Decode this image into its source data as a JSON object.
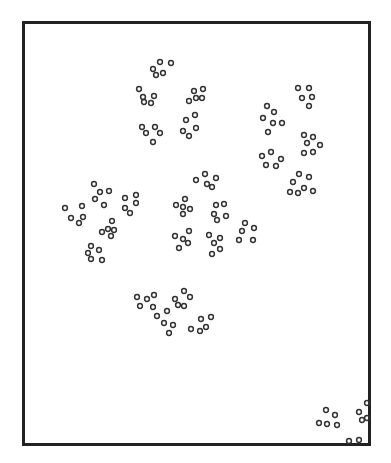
{
  "figure": {
    "kind": "scattered ring clusters within rectangular frame",
    "frame": {
      "x": 22,
      "y": 21,
      "width": 349,
      "height": 425,
      "stroke": "#222222"
    },
    "marker": {
      "shape": "ring",
      "radius": 2.4,
      "stroke": "#333333",
      "stroke_width": 1.5
    },
    "caption": ""
  },
  "points": [
    [
      160,
      62
    ],
    [
      171,
      63
    ],
    [
      153,
      69
    ],
    [
      163,
      73
    ],
    [
      156,
      75
    ],
    [
      139,
      89
    ],
    [
      143,
      97
    ],
    [
      154,
      96
    ],
    [
      144,
      102
    ],
    [
      151,
      103
    ],
    [
      203,
      89
    ],
    [
      194,
      91
    ],
    [
      196,
      98
    ],
    [
      202,
      98
    ],
    [
      189,
      101
    ],
    [
      142,
      127
    ],
    [
      155,
      127
    ],
    [
      146,
      133
    ],
    [
      160,
      133
    ],
    [
      153,
      142
    ],
    [
      195,
      115
    ],
    [
      186,
      120
    ],
    [
      196,
      128
    ],
    [
      183,
      131
    ],
    [
      189,
      136
    ],
    [
      298,
      88
    ],
    [
      309,
      88
    ],
    [
      302,
      98
    ],
    [
      312,
      97
    ],
    [
      309,
      106
    ],
    [
      267,
      106
    ],
    [
      274,
      112
    ],
    [
      263,
      118
    ],
    [
      273,
      123
    ],
    [
      282,
      123
    ],
    [
      268,
      132
    ],
    [
      304,
      135
    ],
    [
      313,
      137
    ],
    [
      307,
      143
    ],
    [
      320,
      145
    ],
    [
      304,
      153
    ],
    [
      313,
      152
    ],
    [
      262,
      156
    ],
    [
      271,
      152
    ],
    [
      281,
      159
    ],
    [
      266,
      165
    ],
    [
      276,
      166
    ],
    [
      299,
      174
    ],
    [
      309,
      177
    ],
    [
      293,
      182
    ],
    [
      304,
      188
    ],
    [
      313,
      191
    ],
    [
      290,
      192
    ],
    [
      298,
      193
    ],
    [
      94,
      184
    ],
    [
      100,
      192
    ],
    [
      109,
      191
    ],
    [
      95,
      199
    ],
    [
      104,
      205
    ],
    [
      65,
      208
    ],
    [
      82,
      206
    ],
    [
      71,
      218
    ],
    [
      83,
      217
    ],
    [
      79,
      223
    ],
    [
      125,
      198
    ],
    [
      136,
      195
    ],
    [
      136,
      203
    ],
    [
      125,
      208
    ],
    [
      130,
      213
    ],
    [
      112,
      221
    ],
    [
      108,
      229
    ],
    [
      114,
      230
    ],
    [
      102,
      232
    ],
    [
      111,
      236
    ],
    [
      91,
      246
    ],
    [
      99,
      250
    ],
    [
      88,
      253
    ],
    [
      91,
      259
    ],
    [
      102,
      260
    ],
    [
      205,
      174
    ],
    [
      216,
      178
    ],
    [
      196,
      180
    ],
    [
      207,
      184
    ],
    [
      212,
      187
    ],
    [
      185,
      199
    ],
    [
      176,
      205
    ],
    [
      183,
      207
    ],
    [
      190,
      209
    ],
    [
      183,
      214
    ],
    [
      216,
      205
    ],
    [
      224,
      204
    ],
    [
      214,
      214
    ],
    [
      226,
      216
    ],
    [
      217,
      220
    ],
    [
      189,
      231
    ],
    [
      175,
      236
    ],
    [
      183,
      239
    ],
    [
      188,
      243
    ],
    [
      179,
      248
    ],
    [
      209,
      235
    ],
    [
      220,
      238
    ],
    [
      214,
      243
    ],
    [
      220,
      249
    ],
    [
      212,
      254
    ],
    [
      245,
      223
    ],
    [
      254,
      228
    ],
    [
      242,
      231
    ],
    [
      239,
      240
    ],
    [
      253,
      240
    ],
    [
      137,
      297
    ],
    [
      147,
      299
    ],
    [
      154,
      295
    ],
    [
      140,
      306
    ],
    [
      153,
      307
    ],
    [
      157,
      316
    ],
    [
      184,
      291
    ],
    [
      175,
      299
    ],
    [
      190,
      297
    ],
    [
      178,
      305
    ],
    [
      184,
      306
    ],
    [
      167,
      311
    ],
    [
      164,
      323
    ],
    [
      173,
      325
    ],
    [
      169,
      333
    ],
    [
      201,
      319
    ],
    [
      211,
      317
    ],
    [
      206,
      327
    ],
    [
      191,
      329
    ],
    [
      200,
      331
    ],
    [
      326,
      410
    ],
    [
      335,
      415
    ],
    [
      319,
      423
    ],
    [
      327,
      424
    ],
    [
      337,
      425
    ],
    [
      359,
      412
    ],
    [
      367,
      403
    ],
    [
      362,
      420
    ],
    [
      367,
      418
    ],
    [
      349,
      441
    ],
    [
      359,
      440
    ]
  ]
}
